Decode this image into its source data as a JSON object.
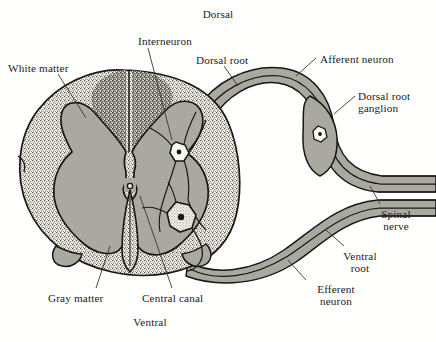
{
  "figure": {
    "width": 436,
    "height": 342,
    "background_color": "#fffffe"
  },
  "colors": {
    "gray_matter": "#a9a9a1",
    "white_matter_base": "#f3f1e9",
    "white_matter_stipple": "#4a4740",
    "dorsal_column_shade": "#9e9c94",
    "nerve_sheath": "#a9a9a1",
    "outline": "#191714",
    "leader_line": "#3a352e",
    "text": "#23201c",
    "cell_body_fill": "#fbfaf4"
  },
  "labels": [
    {
      "id": "dorsal",
      "text": "Dorsal",
      "x": 180,
      "y": 8,
      "align": "center",
      "width": 76
    },
    {
      "id": "interneuron",
      "text": "Interneuron",
      "x": 115,
      "y": 35,
      "align": "center",
      "width": 100
    },
    {
      "id": "white-matter",
      "text": "White matter",
      "x": 8,
      "y": 62,
      "align": "left",
      "width": 92
    },
    {
      "id": "dorsal-root",
      "text": "Dorsal root",
      "x": 196,
      "y": 54,
      "align": "left",
      "width": 80
    },
    {
      "id": "afferent-neuron",
      "text": "Afferent neuron",
      "x": 320,
      "y": 53,
      "align": "left",
      "width": 110
    },
    {
      "id": "dorsal-root-ganglion",
      "text": "Dorsal root\nganglion",
      "x": 358,
      "y": 90,
      "align": "left",
      "width": 78
    },
    {
      "id": "spinal-nerve",
      "text": "Spinal\nnerve",
      "x": 366,
      "y": 208,
      "align": "left",
      "width": 60
    },
    {
      "id": "ventral-root",
      "text": "Ventral\nroot",
      "x": 330,
      "y": 250,
      "align": "left",
      "width": 60
    },
    {
      "id": "efferent-neuron",
      "text": "Efferent\nneuron",
      "x": 306,
      "y": 283,
      "align": "left",
      "width": 66
    },
    {
      "id": "central-canal",
      "text": "Central canal",
      "x": 142,
      "y": 292,
      "align": "left",
      "width": 90
    },
    {
      "id": "gray-matter",
      "text": "Gray matter",
      "x": 48,
      "y": 292,
      "align": "left",
      "width": 84
    },
    {
      "id": "ventral",
      "text": "Ventral",
      "x": 112,
      "y": 316,
      "align": "center",
      "width": 76
    }
  ],
  "anatomy": {
    "structures": [
      "spinal-cord-outline",
      "white-matter",
      "gray-matter-butterfly",
      "central-canal",
      "anterior-median-fissure",
      "posterior-median-sulcus",
      "dorsal-root",
      "dorsal-root-ganglion",
      "ventral-root",
      "spinal-nerve",
      "interneuron-cell-body",
      "sensory-neuron-cell-body",
      "motor-neuron-cell-body"
    ]
  }
}
